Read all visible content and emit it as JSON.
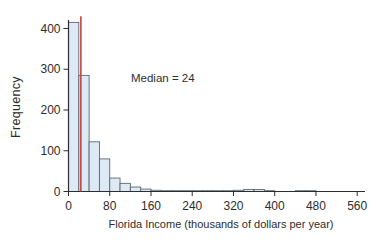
{
  "chart_data": {
    "type": "bar",
    "subtype": "histogram",
    "title": "",
    "xlabel": "Florida Income (thousands of dollars per year)",
    "ylabel": "Frequency",
    "bin_start": 0,
    "bin_width": 20,
    "frequencies": [
      415,
      285,
      122,
      80,
      33,
      20,
      11,
      6,
      3,
      2,
      2,
      2,
      2,
      2,
      2,
      2,
      3,
      5,
      5,
      2,
      0,
      0,
      2,
      2,
      0,
      0,
      0,
      0
    ],
    "x_ticks": [
      0,
      80,
      160,
      240,
      320,
      400,
      480,
      560
    ],
    "y_ticks": [
      0,
      100,
      200,
      300,
      400
    ],
    "xlim": [
      0,
      575
    ],
    "ylim": [
      0,
      430
    ],
    "grid": false,
    "legend": "none",
    "median": 24,
    "median_line": {
      "x": 24,
      "top": 430,
      "color": "#c8433c"
    },
    "annotation": {
      "text": "Median = 24"
    },
    "bar_fill": "#dde9f5",
    "bar_stroke": "#5a6872",
    "axis_color": "#2d2d2d"
  }
}
